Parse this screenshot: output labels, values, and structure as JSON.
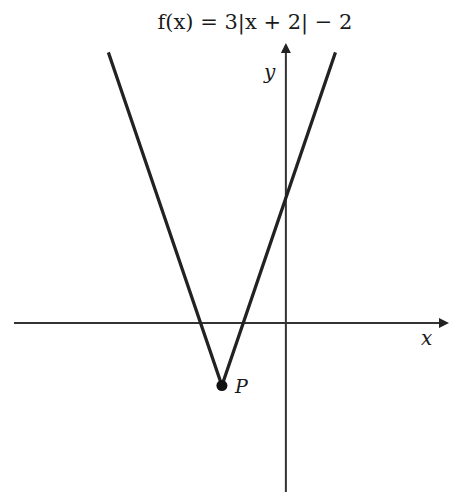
{
  "chart_data": {
    "type": "line",
    "title": "f(x) = 3|x + 2| − 2",
    "xlabel": "x",
    "ylabel": "y",
    "function": {
      "a": 3,
      "h": -2,
      "k": -2,
      "form": "a|x - h| + k"
    },
    "xlim": [
      -8.5,
      5.1
    ],
    "ylim": [
      -5.4,
      8.95
    ],
    "grid": false,
    "ticks": false,
    "series": [
      {
        "name": "f(x)",
        "points": [
          [
            -5.55,
            8.65
          ],
          [
            -2,
            -2
          ],
          [
            1.55,
            8.65
          ]
        ]
      }
    ],
    "annotations": [
      {
        "label": "P",
        "x": -2,
        "y": -2,
        "marker": "filled-circle"
      }
    ],
    "y_intercept": 4,
    "colors": {
      "line": "#222222",
      "axis": "#333333",
      "background": "#ffffff"
    }
  }
}
